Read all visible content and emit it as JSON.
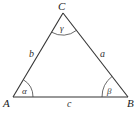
{
  "diagram": {
    "vertices": [
      {
        "name": "A",
        "label": "A",
        "x": 13,
        "y": 97
      },
      {
        "name": "B",
        "label": "B",
        "x": 128,
        "y": 97
      },
      {
        "name": "C",
        "label": "C",
        "x": 63,
        "y": 13
      }
    ],
    "sides": [
      {
        "name": "a",
        "label": "a",
        "between": [
          "B",
          "C"
        ]
      },
      {
        "name": "b",
        "label": "b",
        "between": [
          "A",
          "C"
        ]
      },
      {
        "name": "c",
        "label": "c",
        "between": [
          "A",
          "B"
        ]
      }
    ],
    "angles": [
      {
        "name": "alpha",
        "label": "α",
        "vertex": "A"
      },
      {
        "name": "beta",
        "label": "β",
        "vertex": "B"
      },
      {
        "name": "gamma",
        "label": "γ",
        "vertex": "C"
      }
    ],
    "colors": {
      "line": "#333333",
      "text": "#222222",
      "background": "#ffffff"
    }
  }
}
